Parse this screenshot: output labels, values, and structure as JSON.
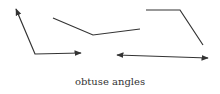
{
  "caption": "obtuse angles",
  "colors": {
    "stroke": "#333333",
    "background": "#ffffff"
  },
  "figures": [
    {
      "name": "angle-1",
      "type": "angle with two rays",
      "points": [
        [
          16,
          9
        ],
        [
          35,
          54
        ],
        [
          81,
          53
        ]
      ],
      "arrows": [
        "start",
        "end"
      ]
    },
    {
      "name": "angle-2",
      "type": "angle of two segments",
      "points": [
        [
          53,
          18
        ],
        [
          93,
          35
        ],
        [
          140,
          29
        ]
      ],
      "arrows": []
    },
    {
      "name": "angle-3",
      "type": "angle of two segments",
      "points": [
        [
          146,
          10
        ],
        [
          180,
          10
        ],
        [
          203,
          45
        ]
      ],
      "arrows": []
    },
    {
      "name": "straight-line",
      "type": "line with arrows both ends",
      "points": [
        [
          117,
          55
        ],
        [
          208,
          58
        ]
      ],
      "arrows": [
        "start",
        "end"
      ]
    }
  ]
}
